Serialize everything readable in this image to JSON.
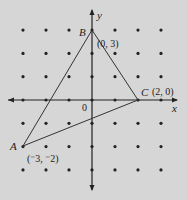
{
  "diagram": {
    "type": "coordinate-grid-triangle",
    "axes": {
      "x_label": "x",
      "y_label": "y",
      "origin_label": "0"
    },
    "grid": {
      "x_range": [
        -3,
        3
      ],
      "y_range": [
        -3,
        3
      ]
    },
    "points": [
      {
        "name": "A",
        "coord_label": "(⁻3, ⁻2)",
        "x": -3,
        "y": -2
      },
      {
        "name": "B",
        "coord_label": "(0, 3)",
        "x": 0,
        "y": 3
      },
      {
        "name": "C",
        "coord_label": "(2, 0)",
        "x": 2,
        "y": 0
      }
    ],
    "colors": {
      "background": "#d6d6d6",
      "ink": "#222222"
    }
  }
}
